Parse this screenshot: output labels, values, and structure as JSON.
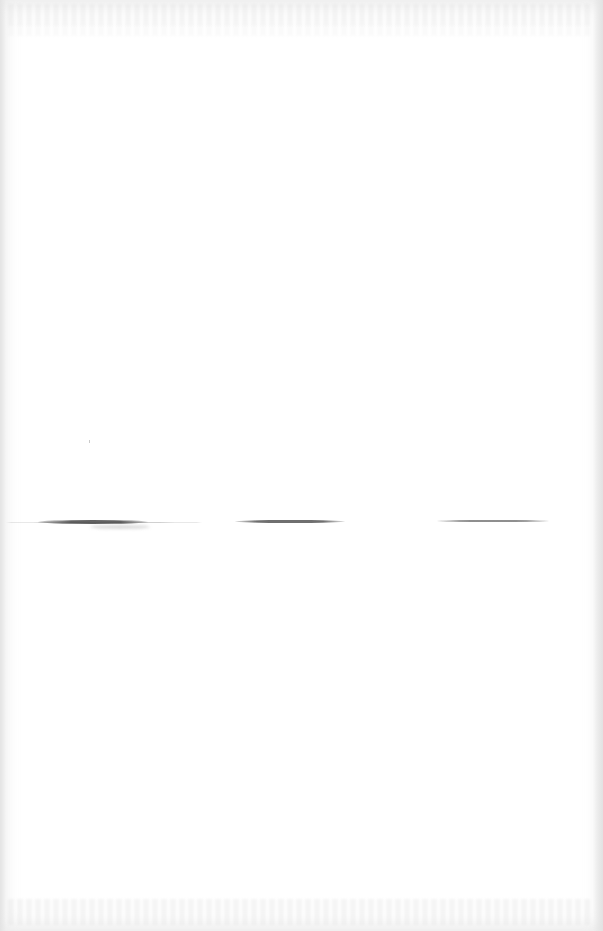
{
  "document": {
    "type": "scanned-page",
    "content": "",
    "signature_lines": [
      {
        "label": ""
      },
      {
        "label": ""
      },
      {
        "label": ""
      }
    ]
  },
  "colors": {
    "paper": "#ffffff",
    "line": "#4a4a4a",
    "edge_shadow": "#e1e1e1"
  }
}
